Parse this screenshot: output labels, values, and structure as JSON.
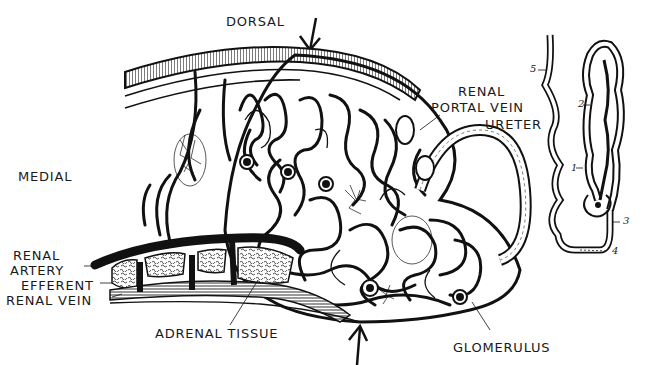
{
  "diagram": {
    "type": "anatomical-illustration",
    "labels": {
      "dorsal": "DORSAL",
      "medial": "MEDIAL",
      "renal_portal_vein_1": "RENAL",
      "renal_portal_vein_2": "PORTAL VEIN",
      "ureter": "URETER",
      "renal_artery_1": "RENAL",
      "renal_artery_2": "ARTERY",
      "efferent_renal_vein_1": "EFFERENT",
      "efferent_renal_vein_2": "RENAL VEIN",
      "adrenal_tissue": "ADRENAL TISSUE",
      "glomerulus": "GLOMERULUS"
    },
    "nephron_inset": {
      "numbers": [
        "1",
        "2",
        "3",
        "4",
        "5"
      ]
    },
    "colors": {
      "ink": "#111111",
      "background": "#ffffff"
    }
  }
}
